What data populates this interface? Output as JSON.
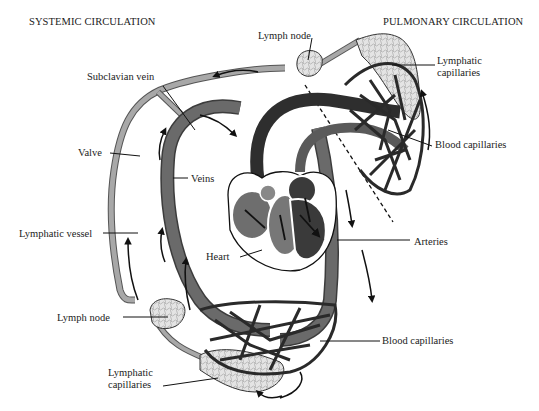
{
  "headers": {
    "systemic": "SYSTEMIC CIRCULATION",
    "pulmonary": "PULMONARY CIRCULATION"
  },
  "labels": {
    "lymph_node_top": "Lymph node",
    "lymphatic_capillaries_top_1": "Lymphatic",
    "lymphatic_capillaries_top_2": "capillaries",
    "subclavian_vein": "Subclavian vein",
    "blood_capillaries_top": "Blood capillaries",
    "valve": "Valve",
    "veins": "Veins",
    "lymphatic_vessel": "Lymphatic vessel",
    "heart": "Heart",
    "arteries": "Arteries",
    "lymph_node_bottom": "Lymph node",
    "blood_capillaries_bottom": "Blood capillaries",
    "lymphatic_capillaries_bottom_1": "Lymphatic",
    "lymphatic_capillaries_bottom_2": "capillaries"
  },
  "colors": {
    "vessel_dark": "#4a4a4a",
    "vessel_mid": "#6e6e6e",
    "lymph_vessel": "#9a9a9a",
    "lymph_tissue": "#d9d9d9",
    "heart_dark": "#3c3c3c",
    "heart_mid": "#777777",
    "line": "#1a1a1a"
  }
}
